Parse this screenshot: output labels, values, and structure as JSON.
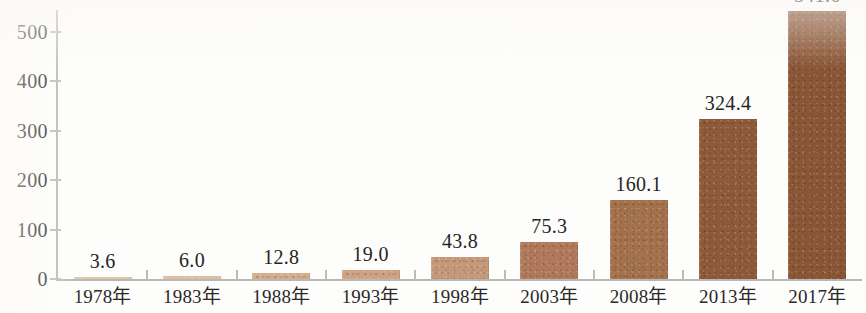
{
  "chart_data": {
    "type": "bar",
    "title": "",
    "subtitle": "",
    "xlabel": "",
    "ylabel": "",
    "categories": [
      "1978年",
      "1983年",
      "1988年",
      "1993年",
      "1998年",
      "2003年",
      "2008年",
      "2013年",
      "2017年"
    ],
    "values": [
      3.6,
      6.0,
      12.8,
      19.0,
      43.8,
      75.3,
      160.1,
      324.4,
      541.6
    ],
    "data_labels": [
      "3.6",
      "6.0",
      "12.8",
      "19.0",
      "43.8",
      "75.3",
      "160.1",
      "324.4",
      "541.6"
    ],
    "bar_colors": [
      "#e0c4a8",
      "#dcbd9c",
      "#d4ae8b",
      "#cda283",
      "#c49878",
      "#b0795c",
      "#a3714b",
      "#8e5a3a",
      "#8b5636"
    ],
    "ylim": [
      0,
      560
    ],
    "yticks": [
      0,
      100,
      200,
      300,
      400,
      500
    ],
    "ytick_labels": [
      "0",
      "100",
      "200",
      "300",
      "400",
      "500"
    ],
    "grid": false,
    "legend": null,
    "notes": {
      "last_label_clipped": "The 2017年 value label is cut off at the top edge of the image"
    }
  },
  "axes": {
    "y_axis_name": "y-axis",
    "x_axis_name": "x-axis"
  }
}
